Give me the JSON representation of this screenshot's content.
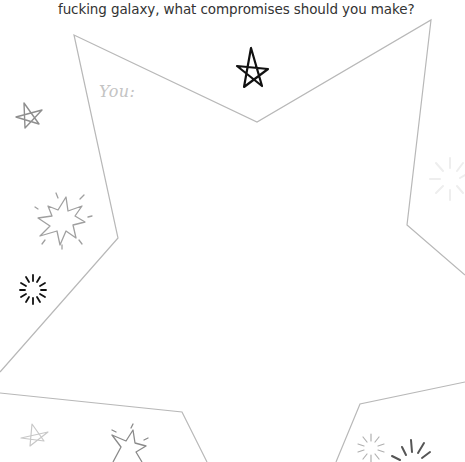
{
  "worksheet": {
    "prompt_text": "fucking galaxy, what compromises should you make?",
    "answer_label": "You:",
    "answer_area_shape": "star-outline",
    "colors": {
      "background": "#ffffff",
      "text": "#333333",
      "outline": "#b8b8b8",
      "label": "#c4c4c4",
      "doodle_dark": "#111111",
      "doodle_light": "#9a9a9a",
      "doodle_faint": "#eeeeee"
    },
    "decorations": [
      {
        "type": "star-doodle",
        "tone": "dark"
      },
      {
        "type": "star-doodle",
        "tone": "light"
      },
      {
        "type": "explosion-doodle",
        "tone": "light"
      },
      {
        "type": "burst-doodle",
        "tone": "dark"
      },
      {
        "type": "burst-doodle",
        "tone": "faint"
      },
      {
        "type": "star-doodle",
        "tone": "faint"
      },
      {
        "type": "explosion-doodle",
        "tone": "light"
      },
      {
        "type": "burst-doodle",
        "tone": "light"
      },
      {
        "type": "burst-doodle",
        "tone": "dark"
      }
    ]
  }
}
